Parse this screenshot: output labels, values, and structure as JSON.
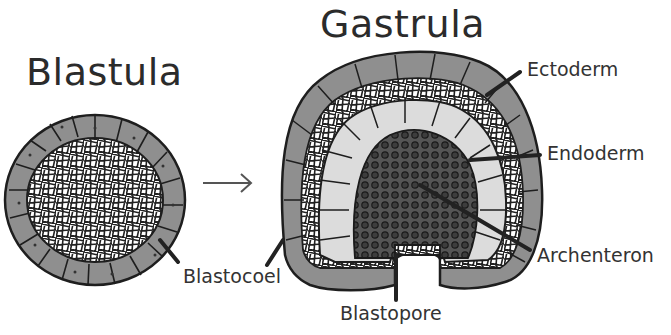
{
  "diagram": {
    "titles": {
      "blastula": "Blastula",
      "gastrula": "Gastrula"
    },
    "labels": {
      "ectoderm": "Ectoderm",
      "endoderm": "Endoderm",
      "archenteron": "Archenteron",
      "blastocoel": "Blastocoel",
      "blastopore": "Blastopore"
    },
    "arrow": "→",
    "colors": {
      "ectoderm_cell": "#8f8f8f",
      "endoderm_cell": "#dcdcdc",
      "archenteron_fill": "#3a3a3a",
      "blastocoel_mesh": "#ffffff",
      "outline": "#1e1e1e",
      "leader_line": "#222222"
    }
  }
}
